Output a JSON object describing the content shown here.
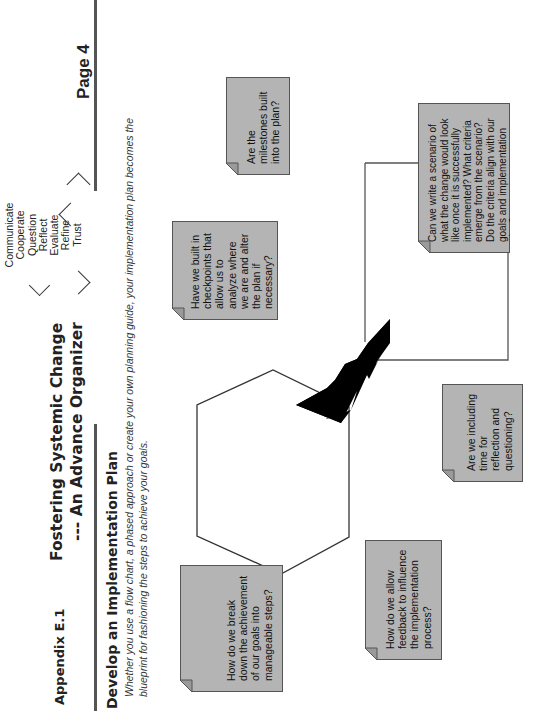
{
  "header": {
    "appendix": "Appendix E.1",
    "title_line1": "Fostering Systemic Change",
    "title_line2": "--- An Advance Organizer",
    "page": "Page 4",
    "values": [
      "Communicate",
      "Cooperate",
      "Question",
      "Reflect",
      "Evaluate",
      "Refine",
      "Trust"
    ]
  },
  "section": {
    "title": "Develop an Implementation Plan",
    "intro_line1": "Whether you use a flow chart, a phased approach or create your own planning guide, your implementation plan becomes the",
    "intro_line2": "blueprint for fashioning the steps to achieve your goals."
  },
  "notes": [
    {
      "id": "break-down",
      "text": "How do we break down the achievement of our goals into manageable steps?"
    },
    {
      "id": "feedback",
      "text": "How do we allow feedback to influence the implementation process?"
    },
    {
      "id": "reflection",
      "text": "Are we including time for reflection and questioning?"
    },
    {
      "id": "checkpoints",
      "text": "Have we built in checkpoints that allow us to analyze where we are and alter the plan if necessary?"
    },
    {
      "id": "scenario",
      "text": "Can we write a scenario of what the change would look like once it is successfully implemented? What criteria emerge from the scenario? Do the criteria align with our goals and implementation plan?"
    },
    {
      "id": "milestones",
      "text": "Are the milestones built into the plan?"
    }
  ],
  "colors": {
    "note_fill": "#b4b4b4",
    "note_border": "#555555",
    "lightning": "#000000",
    "rule": "#555555"
  },
  "icons": {
    "lightning": "lightning-bolt-icon",
    "hexagon": "hexagon-shape"
  }
}
